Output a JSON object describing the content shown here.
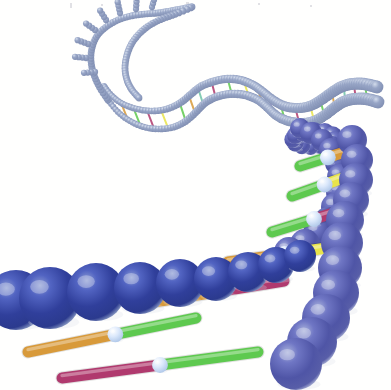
{
  "figure": {
    "title": "DNA double helix",
    "style": "ball-and-stick rendered illustration",
    "background_color": "#fffffe",
    "width": 391,
    "height": 390,
    "alt_text": "Three-dimensional rendering of a DNA double helix receding into the distance, with large blue backbone spheres in the foreground joined by coloured base-pair rods, the strand curving away to the upper right and ending in a hairpin loop at the upper left."
  },
  "palette": {
    "backbone_near_core": "#2e3f96",
    "backbone_near_mid": "#4450b4",
    "backbone_near_rim": "#aebcd8",
    "backbone_far_core": "#5a5fa8",
    "backbone_far_rim": "#c3cbe0",
    "backbone_distant_bead": "#8e9cbd",
    "backbone_distant_rim": "#c8d2e4",
    "joint_sphere": "#cfe0f5",
    "joint_sphere_rim": "#ffffff",
    "rod_green": "#5ec94f",
    "rod_orange": "#d89a3a",
    "rod_magenta": "#b03a6e",
    "rod_yellow": "#e8e34a",
    "rod_teal": "#6fc3a8",
    "rod_violet": "#8f6fbf",
    "shadow": "#d9dee8",
    "speck": "#c9c9cf"
  },
  "structure": {
    "strand_label": "sugar-phosphate backbone",
    "rung_label": "base pair",
    "joint_label": "base pair joint",
    "loop_label": "hairpin loop",
    "spiral_label": "foreshortened helical turn",
    "segments": [
      {
        "name": "foreground-lower-left-strand",
        "depth": "near"
      },
      {
        "name": "foreground-right-strand",
        "depth": "near"
      },
      {
        "name": "midground-curve",
        "depth": "mid"
      },
      {
        "name": "background-wave",
        "depth": "far"
      },
      {
        "name": "hairpin-loop",
        "depth": "far"
      }
    ]
  },
  "near_backbone_lower": {
    "name": "lower-left-foreground-strand",
    "spheres": [
      {
        "cx": 16,
        "cy": 300,
        "r": 30
      },
      {
        "cx": 50,
        "cy": 298,
        "r": 31
      },
      {
        "cx": 96,
        "cy": 292,
        "r": 29
      },
      {
        "cx": 140,
        "cy": 288,
        "r": 26
      },
      {
        "cx": 180,
        "cy": 283,
        "r": 24
      },
      {
        "cx": 216,
        "cy": 279,
        "r": 22
      },
      {
        "cx": 248,
        "cy": 272,
        "r": 20
      },
      {
        "cx": 276,
        "cy": 265,
        "r": 18
      },
      {
        "cx": 300,
        "cy": 256,
        "r": 16
      }
    ]
  },
  "near_backbone_right": {
    "name": "right-foreground-strand",
    "spheres": [
      {
        "cx": 352,
        "cy": 140,
        "r": 15
      },
      {
        "cx": 357,
        "cy": 160,
        "r": 16
      },
      {
        "cx": 356,
        "cy": 180,
        "r": 17
      },
      {
        "cx": 351,
        "cy": 200,
        "r": 18
      },
      {
        "cx": 345,
        "cy": 220,
        "r": 19
      },
      {
        "cx": 342,
        "cy": 243,
        "r": 21
      },
      {
        "cx": 340,
        "cy": 268,
        "r": 22
      },
      {
        "cx": 336,
        "cy": 293,
        "r": 23
      },
      {
        "cx": 326,
        "cy": 318,
        "r": 24
      },
      {
        "cx": 312,
        "cy": 342,
        "r": 25
      },
      {
        "cx": 296,
        "cy": 364,
        "r": 26
      }
    ]
  },
  "mid_backbone": {
    "name": "midground-curving-strand",
    "spheres": [
      {
        "cx": 300,
        "cy": 128,
        "r": 10
      },
      {
        "cx": 311,
        "cy": 133,
        "r": 11
      },
      {
        "cx": 322,
        "cy": 140,
        "r": 11
      },
      {
        "cx": 331,
        "cy": 150,
        "r": 12
      },
      {
        "cx": 337,
        "cy": 163,
        "r": 12
      },
      {
        "cx": 340,
        "cy": 177,
        "r": 13
      },
      {
        "cx": 339,
        "cy": 192,
        "r": 13
      },
      {
        "cx": 335,
        "cy": 207,
        "r": 14
      },
      {
        "cx": 328,
        "cy": 221,
        "r": 14
      },
      {
        "cx": 318,
        "cy": 233,
        "r": 15
      },
      {
        "cx": 305,
        "cy": 244,
        "r": 15
      },
      {
        "cx": 289,
        "cy": 252,
        "r": 15
      }
    ]
  },
  "base_pairs": [
    {
      "id": "bp-1",
      "colors": [
        "#d89a3a",
        "#5ec94f"
      ],
      "x1": 28,
      "y1": 352,
      "x2": 196,
      "y2": 318,
      "joint": 0.52
    },
    {
      "id": "bp-2",
      "colors": [
        "#b03a6e",
        "#5ec94f"
      ],
      "x1": 62,
      "y1": 378,
      "x2": 258,
      "y2": 352,
      "joint": 0.5
    },
    {
      "id": "bp-3",
      "colors": [
        "#d89a3a",
        "#b03a6e"
      ],
      "x1": 148,
      "y1": 303,
      "x2": 284,
      "y2": 281,
      "joint": 0.5
    },
    {
      "id": "bp-4",
      "colors": [
        "#d89a3a",
        "#e8e34a"
      ],
      "x1": 228,
      "y1": 262,
      "x2": 348,
      "y2": 245,
      "joint": 0.47
    },
    {
      "id": "bp-5",
      "colors": [
        "#5ec94f",
        "#b03a6e"
      ],
      "x1": 272,
      "y1": 232,
      "x2": 356,
      "y2": 206,
      "joint": 0.5
    },
    {
      "id": "bp-6",
      "colors": [
        "#5ec94f",
        "#e8e34a"
      ],
      "x1": 292,
      "y1": 196,
      "x2": 360,
      "y2": 172,
      "joint": 0.48
    },
    {
      "id": "bp-7",
      "colors": [
        "#5ec94f",
        "#d89a3a"
      ],
      "x1": 300,
      "y1": 166,
      "x2": 358,
      "y2": 148,
      "joint": 0.48
    }
  ],
  "far_wave": {
    "name": "background-wave-strand",
    "bead_radius_range": [
      3.0,
      6.4
    ],
    "front_path": [
      [
        108,
        100
      ],
      [
        118,
        112
      ],
      [
        130,
        121
      ],
      [
        144,
        127
      ],
      [
        159,
        129
      ],
      [
        174,
        127
      ],
      [
        186,
        121
      ],
      [
        196,
        112
      ],
      [
        205,
        103
      ],
      [
        216,
        97
      ],
      [
        230,
        94
      ],
      [
        245,
        95
      ],
      [
        258,
        100
      ],
      [
        268,
        108
      ],
      [
        277,
        116
      ],
      [
        288,
        121
      ],
      [
        301,
        123
      ],
      [
        314,
        121
      ],
      [
        325,
        115
      ],
      [
        334,
        108
      ],
      [
        343,
        102
      ],
      [
        354,
        99
      ],
      [
        366,
        99
      ],
      [
        378,
        102
      ]
    ],
    "back_path": [
      [
        104,
        86
      ],
      [
        112,
        96
      ],
      [
        123,
        104
      ],
      [
        137,
        109
      ],
      [
        152,
        111
      ],
      [
        167,
        109
      ],
      [
        180,
        103
      ],
      [
        190,
        95
      ],
      [
        200,
        87
      ],
      [
        212,
        82
      ],
      [
        226,
        79
      ],
      [
        240,
        80
      ],
      [
        253,
        85
      ],
      [
        263,
        92
      ],
      [
        273,
        100
      ],
      [
        284,
        106
      ],
      [
        297,
        108
      ],
      [
        310,
        106
      ],
      [
        321,
        100
      ],
      [
        331,
        93
      ],
      [
        341,
        87
      ],
      [
        352,
        84
      ],
      [
        364,
        84
      ],
      [
        377,
        87
      ]
    ]
  },
  "far_rungs": [
    {
      "t": 0.08,
      "color": "#d89a3a"
    },
    {
      "t": 0.12,
      "color": "#5ec94f"
    },
    {
      "t": 0.16,
      "color": "#b03a6e"
    },
    {
      "t": 0.2,
      "color": "#e8e34a"
    },
    {
      "t": 0.26,
      "color": "#5ec94f"
    },
    {
      "t": 0.3,
      "color": "#d89a3a"
    },
    {
      "t": 0.34,
      "color": "#6fc3a8"
    },
    {
      "t": 0.39,
      "color": "#b03a6e"
    },
    {
      "t": 0.44,
      "color": "#5ec94f"
    },
    {
      "t": 0.49,
      "color": "#e8e34a"
    },
    {
      "t": 0.54,
      "color": "#d89a3a"
    },
    {
      "t": 0.59,
      "color": "#8f6fbf"
    },
    {
      "t": 0.64,
      "color": "#5ec94f"
    },
    {
      "t": 0.69,
      "color": "#b03a6e"
    },
    {
      "t": 0.74,
      "color": "#e8e34a"
    },
    {
      "t": 0.78,
      "color": "#5ec94f"
    },
    {
      "t": 0.83,
      "color": "#d89a3a"
    },
    {
      "t": 0.88,
      "color": "#6fc3a8"
    },
    {
      "t": 0.92,
      "color": "#b03a6e"
    },
    {
      "t": 0.96,
      "color": "#5ec94f"
    }
  ],
  "hairpin_loop": {
    "name": "upper-left-hairpin-loop",
    "bead_radius": 3.4,
    "outer_path": [
      [
        108,
        100
      ],
      [
        100,
        88
      ],
      [
        94,
        75
      ],
      [
        91,
        61
      ],
      [
        92,
        48
      ],
      [
        97,
        36
      ],
      [
        106,
        27
      ],
      [
        118,
        20
      ],
      [
        131,
        16
      ],
      [
        145,
        14
      ],
      [
        158,
        13
      ],
      [
        170,
        11
      ],
      [
        181,
        9
      ],
      [
        192,
        7
      ],
      [
        176,
        14
      ],
      [
        162,
        19
      ],
      [
        150,
        25
      ],
      [
        140,
        33
      ],
      [
        132,
        43
      ],
      [
        127,
        55
      ],
      [
        125,
        68
      ],
      [
        127,
        80
      ],
      [
        132,
        90
      ],
      [
        139,
        98
      ]
    ],
    "spikes": [
      {
        "x": 86,
        "y": 58,
        "angle": 186
      },
      {
        "x": 88,
        "y": 44,
        "angle": 200
      },
      {
        "x": 95,
        "y": 30,
        "angle": 216
      },
      {
        "x": 106,
        "y": 20,
        "angle": 238
      },
      {
        "x": 120,
        "y": 13,
        "angle": 258
      },
      {
        "x": 136,
        "y": 9,
        "angle": 274
      },
      {
        "x": 152,
        "y": 7,
        "angle": 286
      },
      {
        "x": 95,
        "y": 72,
        "angle": 176
      }
    ],
    "spike_length": 11
  },
  "spiral_disc": {
    "name": "foreshortened-helical-turn",
    "cx": 312,
    "cy": 140,
    "turns": 2.1,
    "r_outer": 24,
    "bead_count": 26,
    "tilt": 0.42
  },
  "specks": [
    {
      "x": 70,
      "y": 3,
      "w": 2,
      "h": 5
    },
    {
      "x": 101,
      "y": 4,
      "w": 2,
      "h": 2
    },
    {
      "x": 186,
      "y": 2,
      "w": 3,
      "h": 2
    },
    {
      "x": 310,
      "y": 5,
      "w": 2,
      "h": 2
    },
    {
      "x": 258,
      "y": 3,
      "w": 2,
      "h": 2
    },
    {
      "x": 352,
      "y": 230,
      "w": 2,
      "h": 2
    }
  ]
}
